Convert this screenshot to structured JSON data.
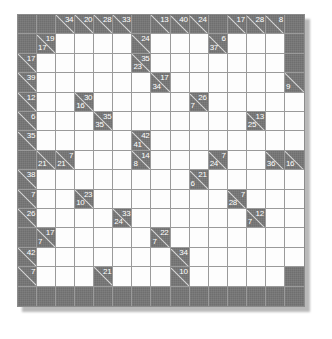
{
  "puzzle": {
    "type": "kakuro",
    "rows": 15,
    "cols": 15,
    "colors": {
      "block": "#6f6f6f",
      "open": "#fdfdfd",
      "grid_line": "#9a9a9a",
      "clue_text": "#ffffff",
      "diagonal": "#d8d8d8",
      "page_background": "#ffffff",
      "shadow": "#b9b9b9"
    },
    "cells": [
      [
        {
          "t": "block"
        },
        {
          "t": "block"
        },
        {
          "t": "clue",
          "across": "34"
        },
        {
          "t": "clue",
          "across": "20"
        },
        {
          "t": "clue",
          "across": "28"
        },
        {
          "t": "clue",
          "across": "33"
        },
        {
          "t": "block"
        },
        {
          "t": "clue",
          "across": "13"
        },
        {
          "t": "clue",
          "across": "40"
        },
        {
          "t": "clue",
          "across": "24"
        },
        {
          "t": "block"
        },
        {
          "t": "clue",
          "across": "17"
        },
        {
          "t": "clue",
          "across": "28"
        },
        {
          "t": "clue",
          "across": "8"
        },
        {
          "t": "block"
        }
      ],
      [
        {
          "t": "block"
        },
        {
          "t": "clue",
          "across": "19",
          "down": "17"
        },
        {
          "t": "open"
        },
        {
          "t": "open"
        },
        {
          "t": "open"
        },
        {
          "t": "open"
        },
        {
          "t": "clue",
          "across": "24"
        },
        {
          "t": "open"
        },
        {
          "t": "open"
        },
        {
          "t": "open"
        },
        {
          "t": "clue",
          "across": "6",
          "down": "37"
        },
        {
          "t": "open"
        },
        {
          "t": "open"
        },
        {
          "t": "open"
        },
        {
          "t": "block"
        }
      ],
      [
        {
          "t": "clue",
          "across": "17"
        },
        {
          "t": "open"
        },
        {
          "t": "open"
        },
        {
          "t": "open"
        },
        {
          "t": "open"
        },
        {
          "t": "open"
        },
        {
          "t": "clue",
          "across": "35",
          "down": "23"
        },
        {
          "t": "open"
        },
        {
          "t": "open"
        },
        {
          "t": "open"
        },
        {
          "t": "open"
        },
        {
          "t": "open"
        },
        {
          "t": "open"
        },
        {
          "t": "open"
        },
        {
          "t": "block"
        }
      ],
      [
        {
          "t": "clue",
          "across": "39"
        },
        {
          "t": "open"
        },
        {
          "t": "open"
        },
        {
          "t": "open"
        },
        {
          "t": "open"
        },
        {
          "t": "open"
        },
        {
          "t": "open"
        },
        {
          "t": "clue",
          "across": "17",
          "down": "34"
        },
        {
          "t": "open"
        },
        {
          "t": "open"
        },
        {
          "t": "open"
        },
        {
          "t": "open"
        },
        {
          "t": "open"
        },
        {
          "t": "open"
        },
        {
          "t": "clue",
          "down": "9"
        }
      ],
      [
        {
          "t": "clue",
          "across": "12"
        },
        {
          "t": "open"
        },
        {
          "t": "open"
        },
        {
          "t": "clue",
          "across": "30",
          "down": "16"
        },
        {
          "t": "open"
        },
        {
          "t": "open"
        },
        {
          "t": "open"
        },
        {
          "t": "open"
        },
        {
          "t": "open"
        },
        {
          "t": "clue",
          "across": "26",
          "down": "7"
        },
        {
          "t": "open"
        },
        {
          "t": "open"
        },
        {
          "t": "open"
        },
        {
          "t": "open"
        },
        {
          "t": "open"
        }
      ],
      [
        {
          "t": "clue",
          "across": "6"
        },
        {
          "t": "open"
        },
        {
          "t": "open"
        },
        {
          "t": "open"
        },
        {
          "t": "clue",
          "across": "35",
          "down": "35"
        },
        {
          "t": "open"
        },
        {
          "t": "open"
        },
        {
          "t": "open"
        },
        {
          "t": "open"
        },
        {
          "t": "open"
        },
        {
          "t": "open"
        },
        {
          "t": "open"
        },
        {
          "t": "clue",
          "across": "13",
          "down": "25"
        },
        {
          "t": "open"
        },
        {
          "t": "open"
        }
      ],
      [
        {
          "t": "clue",
          "across": "35"
        },
        {
          "t": "open"
        },
        {
          "t": "open"
        },
        {
          "t": "open"
        },
        {
          "t": "open"
        },
        {
          "t": "open"
        },
        {
          "t": "clue",
          "across": "42",
          "down": "41"
        },
        {
          "t": "open"
        },
        {
          "t": "open"
        },
        {
          "t": "open"
        },
        {
          "t": "open"
        },
        {
          "t": "open"
        },
        {
          "t": "open"
        },
        {
          "t": "open"
        },
        {
          "t": "open"
        }
      ],
      [
        {
          "t": "block"
        },
        {
          "t": "clue",
          "down": "21"
        },
        {
          "t": "clue",
          "across": "7",
          "down": "21"
        },
        {
          "t": "open"
        },
        {
          "t": "open"
        },
        {
          "t": "open"
        },
        {
          "t": "clue",
          "across": "14",
          "down": "8"
        },
        {
          "t": "open"
        },
        {
          "t": "open"
        },
        {
          "t": "open"
        },
        {
          "t": "clue",
          "across": "7",
          "down": "24"
        },
        {
          "t": "open"
        },
        {
          "t": "open"
        },
        {
          "t": "clue",
          "down": "36"
        },
        {
          "t": "clue",
          "down": "16"
        }
      ],
      [
        {
          "t": "clue",
          "across": "38"
        },
        {
          "t": "open"
        },
        {
          "t": "open"
        },
        {
          "t": "open"
        },
        {
          "t": "open"
        },
        {
          "t": "open"
        },
        {
          "t": "open"
        },
        {
          "t": "open"
        },
        {
          "t": "open"
        },
        {
          "t": "clue",
          "across": "21",
          "down": "6"
        },
        {
          "t": "open"
        },
        {
          "t": "open"
        },
        {
          "t": "open"
        },
        {
          "t": "open"
        },
        {
          "t": "open"
        }
      ],
      [
        {
          "t": "clue",
          "across": "7"
        },
        {
          "t": "open"
        },
        {
          "t": "open"
        },
        {
          "t": "clue",
          "across": "23",
          "down": "10"
        },
        {
          "t": "open"
        },
        {
          "t": "open"
        },
        {
          "t": "open"
        },
        {
          "t": "open"
        },
        {
          "t": "open"
        },
        {
          "t": "open"
        },
        {
          "t": "open"
        },
        {
          "t": "clue",
          "across": "7",
          "down": "28"
        },
        {
          "t": "open"
        },
        {
          "t": "open"
        },
        {
          "t": "open"
        }
      ],
      [
        {
          "t": "clue",
          "across": "26"
        },
        {
          "t": "open"
        },
        {
          "t": "open"
        },
        {
          "t": "open"
        },
        {
          "t": "open"
        },
        {
          "t": "clue",
          "across": "33",
          "down": "24"
        },
        {
          "t": "open"
        },
        {
          "t": "open"
        },
        {
          "t": "open"
        },
        {
          "t": "open"
        },
        {
          "t": "open"
        },
        {
          "t": "open"
        },
        {
          "t": "clue",
          "across": "12",
          "down": "7"
        },
        {
          "t": "open"
        },
        {
          "t": "open"
        }
      ],
      [
        {
          "t": "block"
        },
        {
          "t": "clue",
          "across": "17",
          "down": "7"
        },
        {
          "t": "open"
        },
        {
          "t": "open"
        },
        {
          "t": "open"
        },
        {
          "t": "open"
        },
        {
          "t": "open"
        },
        {
          "t": "clue",
          "across": "22",
          "down": "7"
        },
        {
          "t": "open"
        },
        {
          "t": "open"
        },
        {
          "t": "open"
        },
        {
          "t": "open"
        },
        {
          "t": "open"
        },
        {
          "t": "open"
        },
        {
          "t": "open"
        }
      ],
      [
        {
          "t": "clue",
          "across": "42"
        },
        {
          "t": "open"
        },
        {
          "t": "open"
        },
        {
          "t": "open"
        },
        {
          "t": "open"
        },
        {
          "t": "open"
        },
        {
          "t": "open"
        },
        {
          "t": "open"
        },
        {
          "t": "clue",
          "across": "34"
        },
        {
          "t": "open"
        },
        {
          "t": "open"
        },
        {
          "t": "open"
        },
        {
          "t": "open"
        },
        {
          "t": "open"
        },
        {
          "t": "open"
        }
      ],
      [
        {
          "t": "clue",
          "across": "7"
        },
        {
          "t": "open"
        },
        {
          "t": "open"
        },
        {
          "t": "open"
        },
        {
          "t": "clue",
          "across": "21"
        },
        {
          "t": "open"
        },
        {
          "t": "open"
        },
        {
          "t": "open"
        },
        {
          "t": "clue",
          "across": "10"
        },
        {
          "t": "open"
        },
        {
          "t": "open"
        },
        {
          "t": "open"
        },
        {
          "t": "open"
        },
        {
          "t": "open"
        },
        {
          "t": "block"
        }
      ],
      [
        {
          "t": "block"
        },
        {
          "t": "block"
        },
        {
          "t": "block"
        },
        {
          "t": "block"
        },
        {
          "t": "block"
        },
        {
          "t": "block"
        },
        {
          "t": "block"
        },
        {
          "t": "block"
        },
        {
          "t": "block"
        },
        {
          "t": "block"
        },
        {
          "t": "block"
        },
        {
          "t": "block"
        },
        {
          "t": "block"
        },
        {
          "t": "block"
        },
        {
          "t": "block"
        }
      ]
    ]
  }
}
